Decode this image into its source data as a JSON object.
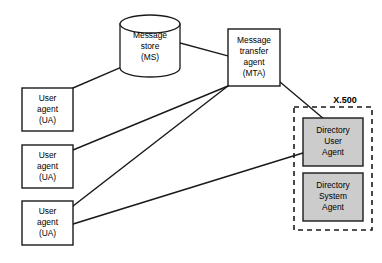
{
  "diagram": {
    "background_color": "#ffffff",
    "line_color": "#1a1a1a",
    "gray_fill": "#cccccc",
    "nodes": {
      "message_store": {
        "shape": "cylinder",
        "line1": "Message",
        "line2": "store",
        "line3": "(MS)"
      },
      "mta": {
        "shape": "rectangle",
        "line1": "Message",
        "line2": "transfer",
        "line3": "agent",
        "line4": "(MTA)"
      },
      "user_agent_1": {
        "shape": "rectangle",
        "line1": "User",
        "line2": "agent",
        "line3": "(UA)"
      },
      "user_agent_2": {
        "shape": "rectangle",
        "line1": "User",
        "line2": "agent",
        "line3": "(UA)"
      },
      "user_agent_3": {
        "shape": "rectangle",
        "line1": "User",
        "line2": "agent",
        "line3": "(UA)"
      },
      "directory_user_agent": {
        "shape": "rectangle",
        "fill": "#cccccc",
        "line1": "Directory",
        "line2": "User",
        "line3": "Agent"
      },
      "directory_system_agent": {
        "shape": "rectangle",
        "fill": "#cccccc",
        "line1": "Directory",
        "line2": "System",
        "line3": "Agent"
      }
    },
    "groups": {
      "x500": {
        "label": "X.500",
        "style": "dashed"
      }
    },
    "connections": [
      {
        "from": "user_agent_1",
        "to": "message_store"
      },
      {
        "from": "message_store",
        "to": "mta"
      },
      {
        "from": "user_agent_2",
        "to": "mta"
      },
      {
        "from": "user_agent_3",
        "to": "mta"
      },
      {
        "from": "mta",
        "to": "directory_user_agent"
      },
      {
        "from": "user_agent_3",
        "to": "directory_user_agent"
      }
    ]
  }
}
